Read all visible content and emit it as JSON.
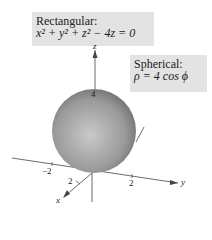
{
  "rectangular": {
    "title": "Rectangular:",
    "equation": "x² + y² + z² − 4z = 0"
  },
  "spherical": {
    "title": "Spherical:",
    "equation": "ρ = 4 cos ϕ"
  },
  "axes": {
    "x_label": "x",
    "y_label": "y",
    "z_label": "z",
    "z_tick": "4",
    "y_tick_neg": "−2",
    "y_tick_pos": "2",
    "x_tick": "2"
  },
  "colors": {
    "label_bg": "#e3e3e3",
    "sphere_light": "#c9c9c9",
    "sphere_dark": "#6e6e6e"
  }
}
